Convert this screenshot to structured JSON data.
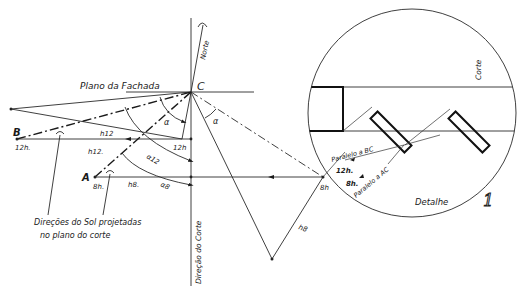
{
  "diagram": {
    "labels": {
      "north": "Norte",
      "facade_plane": "Plano da Fachada",
      "point_c": "C",
      "point_b": "B",
      "point_a": "A",
      "b_time": "12h.",
      "a_time": "8h.",
      "h12_upper": "h12",
      "h12_lower": "h12.",
      "h8": "h8.",
      "alpha": "α",
      "alpha_right": "α",
      "alpha12": "α12",
      "alpha8": "α8",
      "time_12h_center": "12h",
      "time_8h_right": "8h",
      "h8_right": "h8",
      "cut_direction": "Direção do Corte",
      "sun_directions_line1": "Direções do Sol projetadas",
      "sun_directions_line2": "no plano do corte",
      "section": "Corte",
      "parallel_bc": "Paralelo a BC",
      "parallel_ac": "Paralelo a AC",
      "detail_12h": "12h.",
      "detail_8h": "8h.",
      "detail": "Detalhe",
      "figure_number": "1"
    }
  }
}
